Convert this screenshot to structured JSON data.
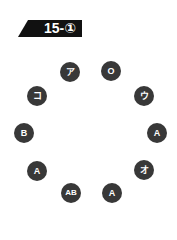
{
  "header": {
    "label": "15-①",
    "background": "#111111",
    "text_color": "#ffffff"
  },
  "circle_color": "#383838",
  "nodes": [
    {
      "label": "ア",
      "x": 70,
      "y": 72
    },
    {
      "label": "O",
      "x": 111,
      "y": 71
    },
    {
      "label": "ウ",
      "x": 144,
      "y": 96
    },
    {
      "label": "A",
      "x": 157,
      "y": 133
    },
    {
      "label": "オ",
      "x": 144,
      "y": 170
    },
    {
      "label": "A",
      "x": 112,
      "y": 193
    },
    {
      "label": "AB",
      "x": 71,
      "y": 193
    },
    {
      "label": "A",
      "x": 37,
      "y": 171
    },
    {
      "label": "B",
      "x": 24,
      "y": 133
    },
    {
      "label": "コ",
      "x": 37,
      "y": 96
    }
  ]
}
